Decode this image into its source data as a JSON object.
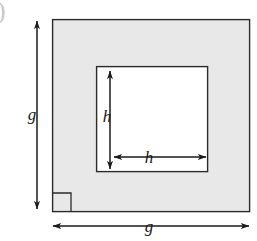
{
  "figure": {
    "caption_fragment": ")",
    "colors": {
      "outer_square_fill": "#e8e8e8",
      "inner_square_fill": "#ffffff",
      "stroke": "#2b2b2b",
      "label_color": "#1a1a1a",
      "page_background": "#ffffff"
    },
    "outer_square": {
      "name": "outer-square",
      "x": 52,
      "y": 19,
      "width": 198,
      "height": 193
    },
    "inner_square": {
      "name": "inner-square",
      "x": 96,
      "y": 66,
      "width": 112,
      "height": 106
    },
    "right_angle_marker": {
      "name": "right-angle-marker",
      "x": 52,
      "y": 193,
      "size": 19
    },
    "dimensions": [
      {
        "id": "outer-height",
        "label": "g",
        "orientation": "vertical",
        "axis_position": 37,
        "start": 20,
        "end": 210,
        "label_x": 32,
        "label_y": 114
      },
      {
        "id": "outer-width",
        "label": "g",
        "orientation": "horizontal",
        "axis_position": 226,
        "start": 52,
        "end": 250,
        "label_x": 149,
        "label_y": 226
      },
      {
        "id": "inner-height",
        "label": "h",
        "orientation": "vertical",
        "axis_position": 110,
        "start": 70,
        "end": 170,
        "label_x": 107,
        "label_y": 116
      },
      {
        "id": "inner-width",
        "label": "h",
        "orientation": "horizontal",
        "axis_position": 157,
        "start": 113,
        "end": 207,
        "label_x": 149,
        "label_y": 157
      }
    ]
  }
}
